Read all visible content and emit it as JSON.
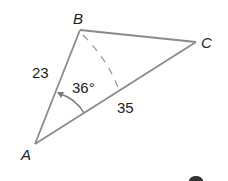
{
  "diagram": {
    "type": "triangle",
    "vertices": {
      "A": {
        "label": "A",
        "x": 35,
        "y": 144
      },
      "B": {
        "label": "B",
        "x": 80,
        "y": 30
      },
      "C": {
        "label": "C",
        "x": 196,
        "y": 42
      }
    },
    "side_labels": {
      "AB": "23",
      "AC": "35"
    },
    "angle_label": "36°",
    "angle_vertex": "A",
    "altitude": {
      "from": "B",
      "to": "AC",
      "style": "dashed"
    },
    "colors": {
      "edge": "#8a8a8a",
      "text": "#222222",
      "arrow": "#7a7a7a"
    }
  }
}
